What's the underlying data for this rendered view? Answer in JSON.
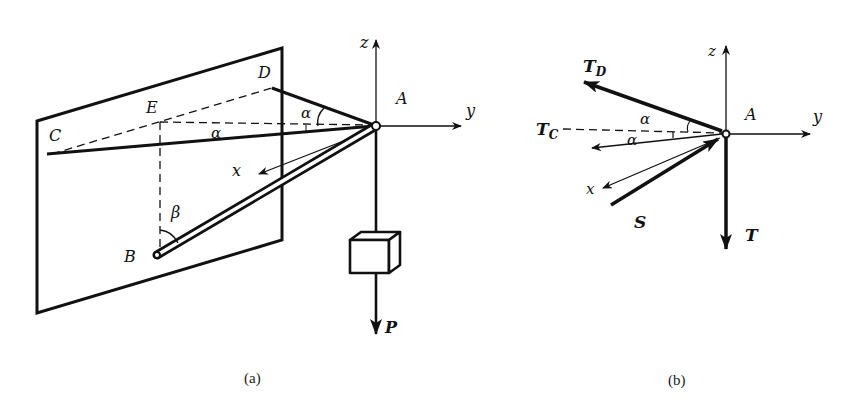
{
  "figure_a": {
    "caption": "(a)",
    "points": {
      "A": "A",
      "B": "B",
      "C": "C",
      "D": "D",
      "E": "E"
    },
    "axes": {
      "x": "x",
      "y": "y",
      "z": "z"
    },
    "angles": {
      "alpha_top": "α",
      "alpha_mid": "α",
      "beta": "β"
    },
    "load_label": "P"
  },
  "figure_b": {
    "caption": "(b)",
    "point": "A",
    "axes": {
      "x": "x",
      "y": "y",
      "z": "z"
    },
    "forces": {
      "TD": {
        "main": "T",
        "sub": "D"
      },
      "TC": {
        "main": "T",
        "sub": "C"
      },
      "S": "S",
      "T": "T"
    },
    "angles": {
      "alpha_upper": "α",
      "alpha_lower": "α"
    }
  },
  "colors": {
    "ink": "#111111",
    "background": "#ffffff"
  }
}
